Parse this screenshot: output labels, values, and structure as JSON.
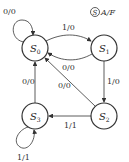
{
  "legend": {
    "circled": "S",
    "text": "A/F"
  },
  "states": [
    {
      "id": "S0",
      "name": "S",
      "sub": "0",
      "cx": 35,
      "cy": 48
    },
    {
      "id": "S1",
      "name": "S",
      "sub": "1",
      "cx": 104,
      "cy": 48
    },
    {
      "id": "S2",
      "name": "S",
      "sub": "2",
      "cx": 104,
      "cy": 116
    },
    {
      "id": "S3",
      "name": "S",
      "sub": "3",
      "cx": 35,
      "cy": 116
    }
  ],
  "transitions": [
    {
      "from": "S0",
      "to": "S0",
      "label": "0/0"
    },
    {
      "from": "S0",
      "to": "S1",
      "label": "1/0"
    },
    {
      "from": "S1",
      "to": "S0",
      "label": "0/0"
    },
    {
      "from": "S1",
      "to": "S2",
      "label": "1/0"
    },
    {
      "from": "S2",
      "to": "S3",
      "label": "1/1"
    },
    {
      "from": "S3",
      "to": "S0",
      "label": "0/0"
    },
    {
      "from": "S2",
      "to": "S0",
      "label": "0/0"
    },
    {
      "from": "S3",
      "to": "S3",
      "label": "1/1"
    }
  ]
}
